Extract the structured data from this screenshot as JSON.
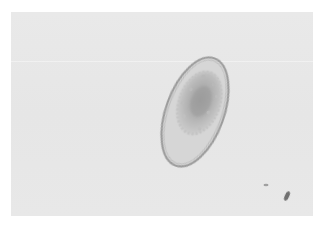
{
  "image": {
    "subject": "microscopic oval parasite egg on light gray background",
    "colors": {
      "background": "#ffffff",
      "field": "#e7e7e7",
      "shell_outer": "#9a9a9a",
      "shell_fill": "#d4d4d4",
      "embryo": "#a8a8a8",
      "debris": "#6e6e6e"
    },
    "elements": [
      {
        "name": "egg",
        "center": [
          195,
          112
        ],
        "size": [
          58,
          112
        ],
        "rotation_deg": 20
      },
      {
        "name": "debris-large",
        "center": [
          287,
          196
        ]
      },
      {
        "name": "debris-small",
        "center": [
          266,
          185
        ]
      }
    ]
  }
}
